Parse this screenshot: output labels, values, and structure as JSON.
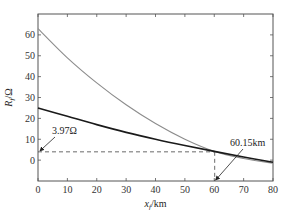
{
  "chart_data": {
    "type": "line",
    "title": "",
    "xlabel": "x_f/km",
    "xlabel_main": "x",
    "xlabel_sub": "f",
    "xlabel_unit": "/km",
    "ylabel": "R_f/Ω",
    "ylabel_main": "R",
    "ylabel_sub": "f",
    "ylabel_unit": "/Ω",
    "xlim": [
      0,
      80
    ],
    "ylim": [
      -10,
      70
    ],
    "xticks": [
      0,
      10,
      20,
      30,
      40,
      50,
      60,
      70,
      80
    ],
    "yticks": [
      0,
      10,
      20,
      30,
      40,
      50,
      60
    ],
    "grid": false,
    "legend": null,
    "x": [
      0,
      10,
      20,
      30,
      40,
      50,
      60,
      70,
      80
    ],
    "series": [
      {
        "name": "gray curve",
        "color": "#8c8c8c",
        "values": [
          63,
          49,
          37,
          26.5,
          17.5,
          10,
          4.2,
          0.8,
          -1.5
        ]
      },
      {
        "name": "black curve",
        "color": "#1a1a1a",
        "values": [
          25,
          21,
          17,
          13.3,
          10,
          7,
          4.2,
          1.5,
          -1
        ]
      }
    ],
    "intersection": {
      "x": 60.15,
      "y": 3.97
    },
    "annotations": [
      {
        "text": "3.97Ω",
        "target": [
          0,
          3.97
        ]
      },
      {
        "text": "60.15km",
        "target": [
          60.15,
          -10
        ]
      }
    ]
  }
}
